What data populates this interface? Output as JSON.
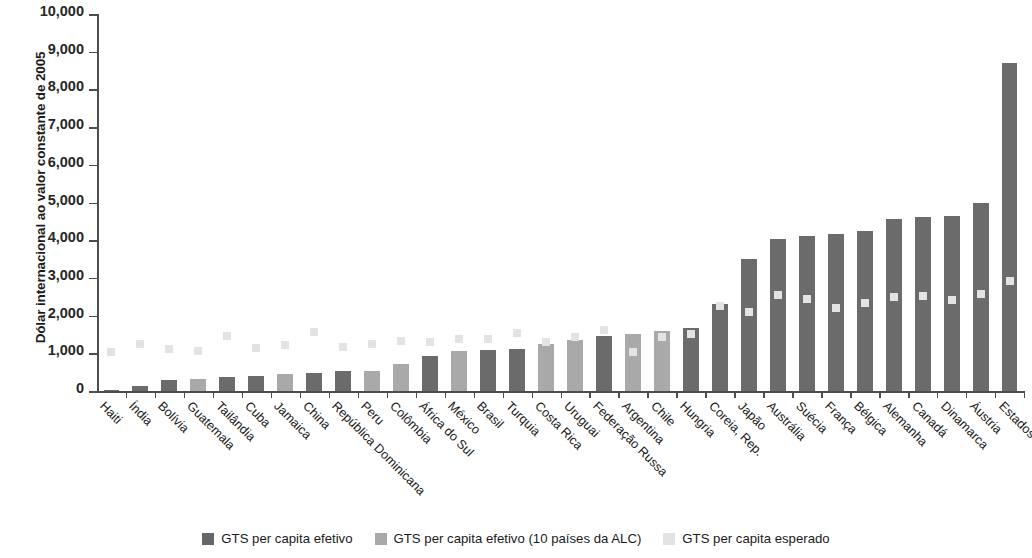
{
  "chart_data": {
    "type": "bar",
    "title": "",
    "xlabel": "",
    "ylabel": "Dólar internacional ao valor constante de 2005",
    "ylim": [
      0,
      10000
    ],
    "ytick_labels": [
      "10,000",
      "9,000",
      "8,000",
      "7,000",
      "6,000",
      "5,000",
      "4,000",
      "3,000",
      "2,000",
      "1,000",
      "0"
    ],
    "ytick_values": [
      10000,
      9000,
      8000,
      7000,
      6000,
      5000,
      4000,
      3000,
      2000,
      1000,
      0
    ],
    "grid": false,
    "legend_position": "bottom",
    "categories": [
      "Haiti",
      "Índia",
      "Bolívia",
      "Guatemala",
      "Tailândia",
      "Cuba",
      "Jamaica",
      "China",
      "República Dominicana",
      "Peru",
      "Colômbia",
      "África do Sul",
      "México",
      "Brasil",
      "Turquia",
      "Costa Rica",
      "Uruguai",
      "Federação Russa",
      "Argentina",
      "Chile",
      "Hungria",
      "Coreia, Rep.",
      "Japão",
      "Austrália",
      "Suécia",
      "França",
      "Bélgica",
      "Alemanha",
      "Canadá",
      "Dinamarca",
      "Áustria",
      "Estados Unidos"
    ],
    "series": [
      {
        "name": "GTS per capita efetivo",
        "color": "#6b6b6b",
        "values": [
          40,
          120,
          300,
          null,
          370,
          400,
          null,
          490,
          520,
          null,
          null,
          930,
          null,
          1080,
          1120,
          null,
          null,
          1470,
          null,
          null,
          1680,
          2300,
          3500,
          4030,
          4110,
          4170,
          4250,
          4550,
          4610,
          4640,
          4980,
          8700
        ]
      },
      {
        "name": "GTS per capita efetivo (10 países da ALC)",
        "color": "#a9a9a9",
        "values": [
          null,
          null,
          null,
          320,
          null,
          null,
          440,
          null,
          null,
          540,
          710,
          null,
          1050,
          null,
          null,
          1260,
          1350,
          null,
          1520,
          1580,
          null,
          null,
          null,
          null,
          null,
          null,
          null,
          null,
          null,
          null,
          null,
          null
        ]
      },
      {
        "name": "GTS per capita esperado",
        "color": "#e3e3e3",
        "marker": "square",
        "values": [
          1030,
          1250,
          1110,
          1060,
          1460,
          1150,
          1220,
          1560,
          1180,
          1250,
          1320,
          1290,
          1390,
          1370,
          1530,
          1290,
          1430,
          1610,
          1030,
          1430,
          1510,
          2260,
          2090,
          2540,
          2430,
          2210,
          2340,
          2490,
          2520,
          2410,
          2570,
          2910
        ]
      }
    ]
  },
  "legend": {
    "items": [
      {
        "label": "GTS per capita efetivo",
        "swatch": "effective"
      },
      {
        "label": "GTS per capita efetivo (10 países da ALC)",
        "swatch": "alc"
      },
      {
        "label": "GTS per capita esperado",
        "swatch": "expected"
      }
    ]
  }
}
